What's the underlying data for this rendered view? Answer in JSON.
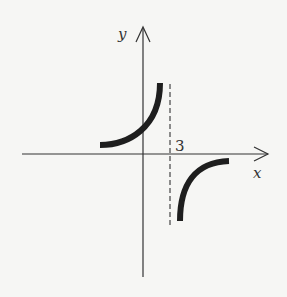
{
  "diagram": {
    "type": "graph-of-function",
    "axes": {
      "x_label": "x",
      "y_label": "y"
    },
    "asymptote": {
      "label": "3",
      "style": "dashed",
      "orientation": "vertical"
    },
    "branches": [
      {
        "name": "left-branch",
        "quadrant": "upper-left of asymptote",
        "direction": "rises toward +infinity approaching asymptote from left"
      },
      {
        "name": "right-branch",
        "quadrant": "lower-right of asymptote",
        "direction": "falls toward -infinity approaching asymptote from right"
      }
    ],
    "colors": {
      "background": "#f6f6f4",
      "ink": "#222222"
    }
  }
}
